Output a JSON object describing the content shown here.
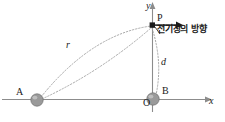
{
  "figure": {
    "background_color": "#ffffff",
    "axes": {
      "x_axis_label": "x",
      "y_axis_label": "y",
      "origin_label": "O",
      "axis_color": "#8c8c8c"
    },
    "points": [
      {
        "id": "A",
        "label": "A",
        "kind": "charged-sphere",
        "x": 37,
        "y": 100
      },
      {
        "id": "B",
        "label": "B",
        "kind": "charged-sphere",
        "x": 153,
        "y": 99
      },
      {
        "id": "P",
        "label": "P",
        "kind": "field-point",
        "x": 152,
        "y": 25
      }
    ],
    "sphere_color": "#9a9a9a",
    "distances": [
      {
        "id": "r",
        "label": "r",
        "from": "A",
        "to": "P"
      },
      {
        "id": "d",
        "label": "d",
        "from": "P",
        "to": "B"
      }
    ],
    "annotation": {
      "field_direction_label": "전기장의 방향",
      "arrow_direction": "right",
      "arrow_color": "#1a1a1a"
    },
    "dashed_curve_color": "#a8a8a8"
  }
}
